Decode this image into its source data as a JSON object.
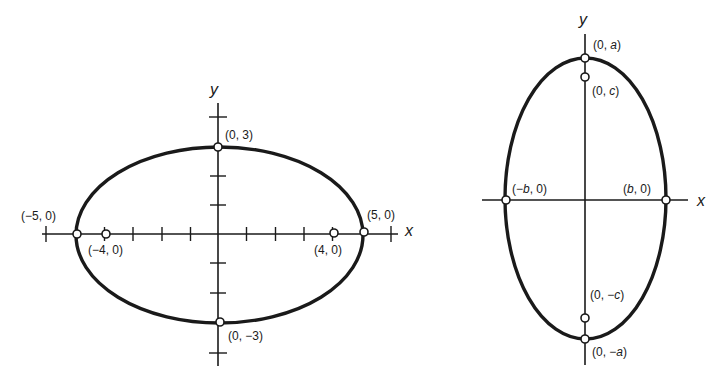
{
  "figures": [
    {
      "id": "left",
      "description": "Horizontal ellipse x^2/25 + y^2/9 = 1",
      "axis_labels": {
        "x": "x",
        "y": "y"
      },
      "points": {
        "top": "(0, 3)",
        "bottom": "(0, −3)",
        "left_vertex": "(−5, 0)",
        "right_vertex": "(5, 0)",
        "left_focus": "(−4, 0)",
        "right_focus": "(4, 0)"
      }
    },
    {
      "id": "right",
      "description": "Vertical ellipse with major axis along y",
      "axis_labels": {
        "x": "x",
        "y": "y"
      },
      "points": {
        "top_vertex": {
          "pre": "(0, ",
          "var": "a",
          "post": ")"
        },
        "top_focus": {
          "pre": "(0, ",
          "var": "c",
          "post": ")"
        },
        "bottom_focus": {
          "pre": "(0, −",
          "var": "c",
          "post": ")"
        },
        "bottom_vertex": {
          "pre": "(0, −",
          "var": "a",
          "post": ")"
        },
        "left_covertex": {
          "pre": "(−",
          "var": "b",
          "post": ", 0)"
        },
        "right_covertex": {
          "pre": "(",
          "var": "b",
          "post": ", 0)"
        }
      }
    }
  ],
  "colors": {
    "ink": "#1a1a1a",
    "background": "#ffffff"
  }
}
